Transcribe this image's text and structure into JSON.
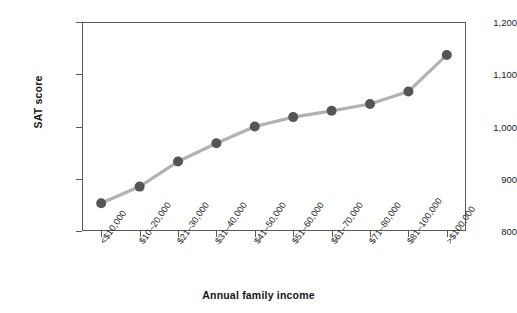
{
  "chart_data": {
    "type": "line",
    "title": "",
    "xlabel": "Annual family income",
    "ylabel": "SAT score",
    "categories": [
      "<$10,000",
      "$10–20,000",
      "$21–30,000",
      "$31–40,000",
      "$41–50,000",
      "$51–60,000",
      "$61–70,000",
      "$71–80,000",
      "$81–100,000",
      ">$100,000"
    ],
    "values": [
      853,
      885,
      933,
      968,
      1000,
      1018,
      1030,
      1043,
      1067,
      1137
    ],
    "ylim": [
      800,
      1200
    ],
    "yticks": [
      800,
      900,
      1000,
      1100,
      1200
    ],
    "ytick_labels": [
      "800",
      "900",
      "1,000",
      "1,100",
      "1,200"
    ],
    "grid": false,
    "legend": null,
    "series": [
      {
        "name": "SAT score",
        "values": [
          853,
          885,
          933,
          968,
          1000,
          1018,
          1030,
          1043,
          1067,
          1137
        ]
      }
    ]
  },
  "colors": {
    "line": "#b2b2b2",
    "marker": "#555555",
    "axis": "#5a5a5a",
    "text": "#1b1b1b",
    "background": "#ffffff"
  }
}
